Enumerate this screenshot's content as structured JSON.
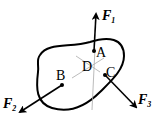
{
  "diagram": {
    "type": "rigid body free-body diagram",
    "points": [
      {
        "id": "A",
        "label": "A"
      },
      {
        "id": "B",
        "label": "B"
      },
      {
        "id": "C",
        "label": "C"
      },
      {
        "id": "D",
        "label": "D"
      }
    ],
    "forces": [
      {
        "id": "F1",
        "symbol": "F",
        "subscript": "1",
        "applied_at": "A",
        "direction": "up"
      },
      {
        "id": "F2",
        "symbol": "F",
        "subscript": "2",
        "applied_at": "B",
        "direction": "down-left"
      },
      {
        "id": "F3",
        "symbol": "F",
        "subscript": "3",
        "applied_at": "C",
        "direction": "down-right"
      }
    ],
    "colors": {
      "ink": "#000000",
      "guide": "#b0b0b0",
      "background": "#ffffff"
    }
  }
}
